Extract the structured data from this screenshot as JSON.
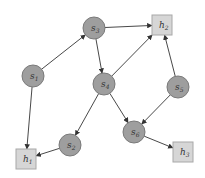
{
  "diagram": {
    "type": "directed-graph",
    "colors": {
      "circle_fill": "#9e9e9e",
      "circle_stroke": "#7a7a7a",
      "square_fill": "#d6d6d6",
      "square_stroke": "#a8a8a8",
      "edge": "#333333",
      "label": "#333333"
    },
    "nodes": [
      {
        "id": "s1",
        "base": "s",
        "sub": "1",
        "shape": "circle",
        "x": 33,
        "y": 76
      },
      {
        "id": "s3",
        "base": "s",
        "sub": "3",
        "shape": "circle",
        "x": 94,
        "y": 28
      },
      {
        "id": "s4",
        "base": "s",
        "sub": "4",
        "shape": "circle",
        "x": 104,
        "y": 84
      },
      {
        "id": "s5",
        "base": "s",
        "sub": "5",
        "shape": "circle",
        "x": 178,
        "y": 87
      },
      {
        "id": "s6",
        "base": "s",
        "sub": "6",
        "shape": "circle",
        "x": 134,
        "y": 132
      },
      {
        "id": "s2",
        "base": "s",
        "sub": "2",
        "shape": "circle",
        "x": 70,
        "y": 145
      },
      {
        "id": "h2",
        "base": "h",
        "sub": "2",
        "shape": "square",
        "x": 162,
        "y": 25
      },
      {
        "id": "h1",
        "base": "h",
        "sub": "1",
        "shape": "square",
        "x": 26,
        "y": 159
      },
      {
        "id": "h3",
        "base": "h",
        "sub": "3",
        "shape": "square",
        "x": 183,
        "y": 152
      }
    ],
    "edges": [
      {
        "from": "s1",
        "to": "s3"
      },
      {
        "from": "s1",
        "to": "h1"
      },
      {
        "from": "s3",
        "to": "h2"
      },
      {
        "from": "s3",
        "to": "s4"
      },
      {
        "from": "s4",
        "to": "h2"
      },
      {
        "from": "s4",
        "to": "s2"
      },
      {
        "from": "s4",
        "to": "s6"
      },
      {
        "from": "s5",
        "to": "h2"
      },
      {
        "from": "s5",
        "to": "s6"
      },
      {
        "from": "s6",
        "to": "h3"
      },
      {
        "from": "s2",
        "to": "h1"
      }
    ]
  }
}
